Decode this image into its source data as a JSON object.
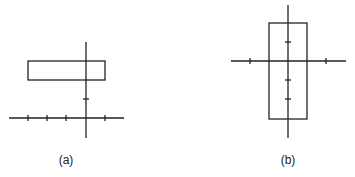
{
  "figures": [
    {
      "id": "a",
      "caption": "(a)",
      "description": "Horizontal rectangle above horizontal axis, crossing vertical axis",
      "axes": {
        "origin": [
          86,
          118
        ],
        "x_range": [
          9,
          124
        ],
        "y_range": [
          42,
          138
        ]
      },
      "x_ticks": [
        28,
        47,
        66,
        105
      ],
      "y_ticks": [
        99
      ],
      "rect": {
        "x1": 28,
        "y1": 61,
        "x2": 105,
        "y2": 80
      }
    },
    {
      "id": "b",
      "caption": "(b)",
      "description": "Vertical rectangle centered on vertical axis, crossing horizontal axis",
      "axes": {
        "origin": [
          288,
          61
        ],
        "x_range": [
          231,
          346
        ],
        "y_range": [
          5,
          138
        ]
      },
      "x_ticks": [
        250,
        326
      ],
      "y_ticks": [
        42,
        80,
        99
      ],
      "rect": {
        "x1": 269,
        "y1": 23,
        "x2": 307,
        "y2": 119
      }
    }
  ],
  "colors": {
    "stroke": "#222222",
    "background": "#ffffff"
  }
}
